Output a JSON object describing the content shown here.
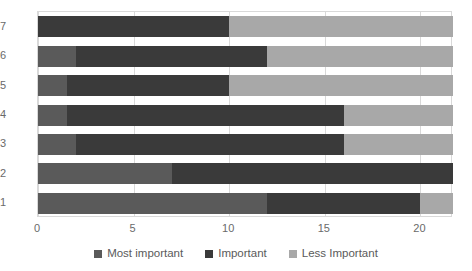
{
  "chart_data": {
    "type": "bar",
    "orientation": "horizontal",
    "stacked": true,
    "title": "",
    "xlabel": "",
    "ylabel": "",
    "categories": [
      "1",
      "2",
      "3",
      "4",
      "5",
      "6",
      "7"
    ],
    "series": [
      {
        "name": "Most important",
        "color": "#5a5a5a",
        "values": [
          12,
          7,
          2,
          1.5,
          1.5,
          2,
          0
        ]
      },
      {
        "name": "Important",
        "color": "#3a3a3a",
        "values": [
          8,
          14.7,
          14,
          14.5,
          8.5,
          10,
          10
        ]
      },
      {
        "name": "Less Important",
        "color": "#a8a8a8",
        "values": [
          1.7,
          0,
          5.7,
          5.7,
          11.7,
          9.7,
          11.7
        ]
      }
    ],
    "xticks": [
      "0",
      "5",
      "10",
      "15",
      "20"
    ],
    "xtick_values": [
      0,
      5,
      10,
      15,
      20
    ],
    "xlim": [
      0,
      21.7
    ],
    "grid": true,
    "legend_position": "bottom"
  },
  "legend": {
    "items": [
      {
        "label": "Most important",
        "color": "#5a5a5a"
      },
      {
        "label": "Important",
        "color": "#3a3a3a"
      },
      {
        "label": "Less Important",
        "color": "#a8a8a8"
      }
    ]
  },
  "axes": {
    "x_tick_labels": [
      "0",
      "5",
      "10",
      "15",
      "20"
    ],
    "y_tick_labels": [
      "7",
      "6",
      "5",
      "4",
      "3",
      "2",
      "1"
    ]
  },
  "colors": {
    "grid": "#d9d9d9",
    "background": "#ffffff",
    "text": "#5a5a5a"
  }
}
